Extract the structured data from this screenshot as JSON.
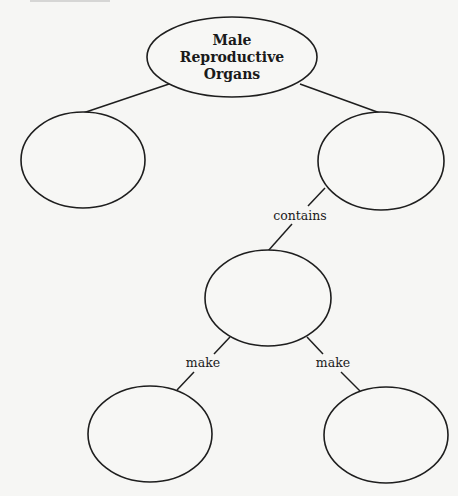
{
  "diagram": {
    "type": "concept-map",
    "top_cut_text": "",
    "root": {
      "label_lines": [
        "Male",
        "Reproductive",
        "Organs"
      ]
    },
    "nodes": {
      "left": "",
      "right": "",
      "middle": "",
      "bottom_left": "",
      "bottom_right": ""
    },
    "edges": {
      "root_to_left": "",
      "root_to_right": "",
      "right_to_middle": "contains",
      "middle_to_bottom_left": "make",
      "middle_to_bottom_right": "make"
    },
    "colors": {
      "background": "#f6f6f4",
      "stroke": "#1e1e1e",
      "text": "#1a1a1a"
    }
  }
}
